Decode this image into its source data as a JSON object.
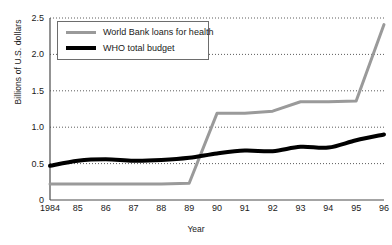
{
  "chart_data": {
    "type": "line",
    "title": "",
    "xlabel": "Year",
    "ylabel": "Billions of U.S. dollars",
    "xlim": [
      1984,
      1996
    ],
    "ylim": [
      0,
      2.5
    ],
    "grid": "horizontal-dotted",
    "legend_position": "top-left",
    "x": [
      1984,
      1985,
      1986,
      1987,
      1988,
      1989,
      1990,
      1991,
      1992,
      1993,
      1994,
      1995,
      1996
    ],
    "xtick_labels": [
      "1984",
      "85",
      "86",
      "87",
      "88",
      "89",
      "90",
      "91",
      "92",
      "93",
      "94",
      "95",
      "96"
    ],
    "ytick_labels": [
      "0",
      "0.5",
      "1.0",
      "1.5",
      "2.0",
      "2.5"
    ],
    "ytick_values": [
      0,
      0.5,
      1.0,
      1.5,
      2.0,
      2.5
    ],
    "series": [
      {
        "name": "World Bank loans for health",
        "color": "#9a9a9a",
        "width": 3,
        "smooth": false,
        "values": [
          0.22,
          0.22,
          0.22,
          0.22,
          0.22,
          0.23,
          1.19,
          1.19,
          1.22,
          1.35,
          1.35,
          1.36,
          2.41
        ]
      },
      {
        "name": "WHO total budget",
        "color": "#000000",
        "width": 4,
        "smooth": true,
        "values": [
          0.47,
          0.54,
          0.56,
          0.54,
          0.55,
          0.58,
          0.64,
          0.68,
          0.67,
          0.73,
          0.72,
          0.82,
          0.9
        ]
      }
    ]
  },
  "legend": {
    "items": [
      {
        "label": "World Bank loans for health",
        "swatch": "gray"
      },
      {
        "label": "WHO total budget",
        "swatch": "black"
      }
    ]
  },
  "axes": {
    "y_title": "Billions of U.S. dollars",
    "x_title": "Year"
  }
}
